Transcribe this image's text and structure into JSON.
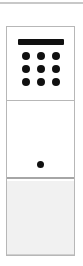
{
  "widget": {
    "name": "keypad-widget",
    "width": 83,
    "height": 266,
    "background": "#ffffff"
  },
  "top_rule": {
    "name": "top-divider",
    "color": "#c8c8c8"
  },
  "card": {
    "name": "stacked-card",
    "border_color": "#b7b7b7",
    "background": "#ffffff"
  },
  "panels": [
    {
      "name": "keypad-panel",
      "background": "#ffffff",
      "glyph": {
        "name": "calculator-icon",
        "bar_color": "#101010",
        "key_color": "#101010",
        "rows": 3,
        "columns": 3,
        "key_count": 9
      }
    },
    {
      "name": "display-panel",
      "background": "#ffffff",
      "indicator": {
        "name": "indicator-dot",
        "color": "#101010",
        "count": 1
      }
    },
    {
      "name": "footer-panel",
      "background": "#f1f1f1",
      "border_color": "#cfcfcf"
    }
  ],
  "keys": [
    {
      "label": ""
    },
    {
      "label": ""
    },
    {
      "label": ""
    },
    {
      "label": ""
    },
    {
      "label": ""
    },
    {
      "label": ""
    },
    {
      "label": ""
    },
    {
      "label": ""
    },
    {
      "label": ""
    }
  ]
}
